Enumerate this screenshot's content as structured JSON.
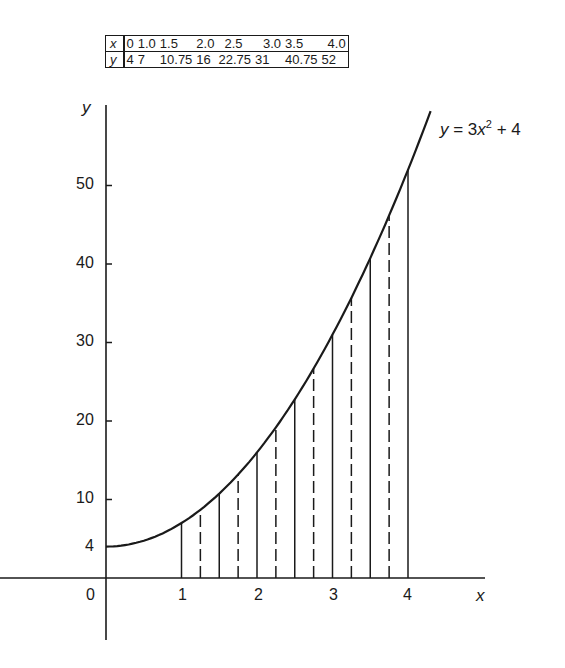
{
  "table": {
    "x_label": "x",
    "y_label": "y",
    "x_values": [
      "0",
      "1.0",
      "1.5",
      "2.0",
      "2.5",
      "3.0",
      "3.5",
      "4.0"
    ],
    "y_values": [
      "4",
      "7",
      "10.75",
      "16",
      "22.75",
      "31",
      "40.75",
      "52"
    ]
  },
  "axes": {
    "x_label": "x",
    "y_label": "y",
    "origin_label": "0",
    "x_ticks": [
      "1",
      "2",
      "3",
      "4"
    ],
    "y_ticks": [
      "4",
      "10",
      "20",
      "30",
      "40",
      "50"
    ]
  },
  "equation": {
    "lhs": "y",
    "eq": " = 3",
    "var": "x",
    "exp": "2",
    "rest": " + 4"
  },
  "chart_data": {
    "type": "line",
    "title": "",
    "function": "y = 3x^2 + 4",
    "xlabel": "x",
    "ylabel": "y",
    "x": [
      0,
      1.0,
      1.5,
      2.0,
      2.5,
      3.0,
      3.5,
      4.0
    ],
    "series": [
      {
        "name": "y = 3x^2 + 4",
        "values": [
          4,
          7,
          10.75,
          16,
          22.75,
          31,
          40.75,
          52
        ]
      }
    ],
    "table_rows": {
      "x": [
        0,
        1.0,
        1.5,
        2.0,
        2.5,
        3.0,
        3.5,
        4.0
      ],
      "y": [
        4,
        7,
        10.75,
        16,
        22.75,
        31,
        40.75,
        52
      ]
    },
    "solid_ordinates_x": [
      1,
      1.5,
      2,
      2.5,
      3,
      3.5,
      4
    ],
    "dashed_ordinates_x": [
      1.25,
      1.75,
      2.25,
      2.75,
      3.25,
      3.75
    ],
    "x_ticks": [
      0,
      1,
      2,
      3,
      4
    ],
    "y_ticks": [
      4,
      10,
      20,
      30,
      40,
      50
    ],
    "xlim": [
      -1.4,
      5.0
    ],
    "ylim": [
      -8,
      60
    ],
    "grid": false,
    "legend": "none",
    "annotations": [
      "y = 3x^2 + 4"
    ]
  }
}
